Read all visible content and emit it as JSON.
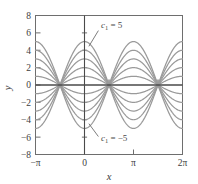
{
  "figure": {
    "kind": "math-plot",
    "background": "#ffffff",
    "frame_color": "#6e6e6e",
    "curve_color": "#9a9a9a",
    "axis_line_color": "#4a4a4a",
    "text_color": "#3d3d3d"
  },
  "chart_data": {
    "type": "line",
    "title": "",
    "xlabel": "x",
    "ylabel": "y",
    "xlim": [
      -3.141592653589793,
      6.283185307179586
    ],
    "ylim": [
      -8,
      8
    ],
    "grid": false,
    "legend": null,
    "xticks": [
      -3.141592653589793,
      0,
      3.141592653589793,
      6.283185307179586
    ],
    "xticklabels": [
      "−π",
      "0",
      "π",
      "2π"
    ],
    "yticks": [
      8,
      6,
      4,
      2,
      0,
      -2,
      -4,
      -6,
      -8
    ],
    "yticklabels": [
      "8",
      "6",
      "4",
      "2",
      "0",
      "−2",
      "−4",
      "−6",
      "−8"
    ],
    "minor_xticks": [
      -1.5707963267948966,
      1.5707963267948966,
      4.71238898038469
    ],
    "function": "y = c1 * cos(x)",
    "parameter_name": "c1",
    "parameter_values": [
      -5,
      -4,
      -3,
      -2,
      -1,
      1,
      2,
      3,
      4,
      5
    ],
    "nodes_x": [
      -1.5707963267948966,
      1.5707963267948966,
      4.71238898038469
    ],
    "peaks": [
      {
        "x": 0,
        "values": [
          5,
          4,
          3,
          2,
          1,
          -1,
          -2,
          -3,
          -4,
          -5
        ]
      },
      {
        "x": 3.141592653589793,
        "values": [
          -5,
          -4,
          -3,
          -2,
          -1,
          1,
          2,
          3,
          4,
          5
        ]
      },
      {
        "x": -3.141592653589793,
        "values": [
          -5,
          -4,
          -3,
          -2,
          -1,
          1,
          2,
          3,
          4,
          5
        ]
      },
      {
        "x": 6.283185307179586,
        "values": [
          5,
          4,
          3,
          2,
          1,
          -1,
          -2,
          -3,
          -4,
          -5
        ]
      }
    ],
    "annotations": [
      {
        "name": "upper-parameter-label",
        "text_prefix": "c",
        "text_sub": "1",
        "text_suffix": " = 5",
        "value": 5,
        "label_x": 1.05,
        "label_y": 6.55,
        "leader_to_x": 0.28,
        "leader_to_y": 4.45
      },
      {
        "name": "lower-parameter-label",
        "text_prefix": "c",
        "text_sub": "1",
        "text_suffix": " = −5",
        "value": -5,
        "label_x": 1.05,
        "label_y": -6.45,
        "leader_to_x": 0.28,
        "leader_to_y": -4.45
      }
    ]
  }
}
